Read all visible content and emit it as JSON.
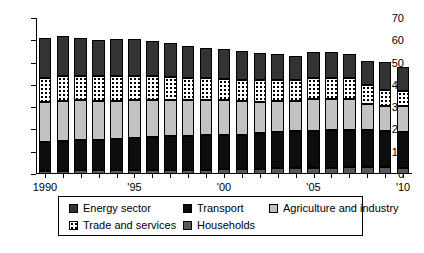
{
  "chart_data": {
    "type": "bar",
    "stacked": true,
    "title": "",
    "subtitle": "",
    "xlabel": "",
    "ylabel": "",
    "ylim": [
      0,
      70
    ],
    "yticks": [
      0,
      10,
      20,
      30,
      40,
      50,
      60,
      70
    ],
    "grid": false,
    "legend_position": "bottom",
    "categories": [
      "1990",
      "1991",
      "1992",
      "1993",
      "1994",
      "1995",
      "1996",
      "1997",
      "1998",
      "1999",
      "2000",
      "2001",
      "2002",
      "2003",
      "2004",
      "2005",
      "2006",
      "2007",
      "2008",
      "2009",
      "2010"
    ],
    "tick_labels": [
      "1990",
      "",
      "",
      "",
      "",
      "'95",
      "",
      "",
      "",
      "",
      "'00",
      "",
      "",
      "",
      "",
      "'05",
      "",
      "",
      "",
      "",
      "'10"
    ],
    "series": [
      {
        "name": "Households",
        "order": 1,
        "color": "#595959",
        "pattern": "solid-dark-gray",
        "values": [
          1.2,
          1.5,
          1.6,
          1.6,
          1.7,
          1.8,
          1.9,
          1.9,
          2.0,
          2.0,
          2.1,
          2.2,
          2.4,
          2.5,
          2.6,
          2.7,
          2.9,
          3.0,
          3.1,
          3.0,
          2.9
        ]
      },
      {
        "name": "Transport",
        "order": 2,
        "color": "#0d0d0d",
        "pattern": "solid-black",
        "values": [
          13.1,
          13.3,
          13.6,
          13.7,
          13.8,
          14.2,
          14.8,
          15.0,
          15.2,
          15.3,
          15.4,
          15.5,
          15.8,
          16.3,
          16.5,
          16.8,
          16.9,
          16.9,
          16.7,
          16.2,
          16.1
        ]
      },
      {
        "name": "Agriculture and industry",
        "order": 3,
        "color": "#c2c2c2",
        "pattern": "solid-light-gray",
        "values": [
          18.0,
          17.9,
          17.8,
          17.6,
          17.4,
          17.1,
          16.6,
          16.4,
          16.2,
          16.0,
          15.7,
          15.2,
          14.3,
          13.9,
          13.6,
          14.0,
          13.9,
          13.6,
          11.4,
          11.5,
          11.6
        ]
      },
      {
        "name": "Trade and services",
        "order": 4,
        "color": "#ffffff",
        "pattern": "white-dotted",
        "values": [
          11.0,
          11.3,
          11.0,
          10.9,
          10.9,
          10.8,
          10.5,
          10.3,
          9.9,
          9.8,
          9.6,
          9.5,
          9.7,
          9.5,
          9.4,
          9.6,
          9.6,
          9.5,
          8.8,
          7.2,
          6.6
        ]
      },
      {
        "name": "Energy sector",
        "order": 5,
        "color": "#333333",
        "pattern": "solid-dark",
        "values": [
          17.7,
          18.0,
          17.2,
          16.4,
          16.8,
          16.5,
          15.9,
          15.0,
          14.3,
          13.6,
          13.1,
          12.9,
          12.0,
          11.8,
          10.8,
          11.8,
          11.5,
          10.7,
          10.5,
          12.3,
          10.7
        ]
      }
    ],
    "totals": [
      61.0,
      62.0,
      61.2,
      60.2,
      60.6,
      60.4,
      59.7,
      58.6,
      57.6,
      56.7,
      55.9,
      55.3,
      54.2,
      54.0,
      52.9,
      53.4,
      54.8,
      54.7,
      53.7,
      50.2,
      47.9
    ]
  },
  "legend": {
    "items": [
      {
        "label": "Energy sector",
        "swatch": "swatch-energy"
      },
      {
        "label": "Transport",
        "swatch": "swatch-transport"
      },
      {
        "label": "Agriculture and industry",
        "swatch": "swatch-agriculture"
      },
      {
        "label": "Trade and services",
        "swatch": "swatch-trade"
      },
      {
        "label": "Households",
        "swatch": "swatch-households"
      }
    ]
  }
}
